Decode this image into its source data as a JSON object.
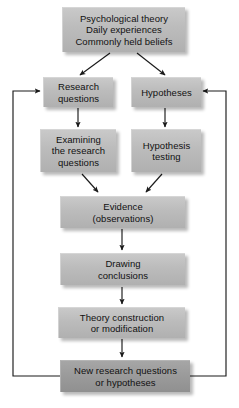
{
  "diagram": {
    "colors": {
      "box_fill_light": "#bcbcbc",
      "box_fill_dark": "#9b9b9b",
      "text": "#111111",
      "arrow": "#1a1a1a",
      "background": "#ffffff"
    },
    "nodes": [
      {
        "id": "sources",
        "label": "Psychological theory\nDaily experiences\nCommonly held beliefs",
        "shade": "light"
      },
      {
        "id": "research-questions",
        "label": "Research\nquestions",
        "shade": "light"
      },
      {
        "id": "hypotheses",
        "label": "Hypotheses",
        "shade": "light"
      },
      {
        "id": "examining-research-questions",
        "label": "Examining\nthe research\nquestions",
        "shade": "light"
      },
      {
        "id": "hypothesis-testing",
        "label": "Hypothesis\ntesting",
        "shade": "light"
      },
      {
        "id": "evidence",
        "label": "Evidence\n(observations)",
        "shade": "light"
      },
      {
        "id": "drawing-conclusions",
        "label": "Drawing\nconclusions",
        "shade": "light"
      },
      {
        "id": "theory-construction",
        "label": "Theory construction\nor modification",
        "shade": "light"
      },
      {
        "id": "new-research-questions",
        "label": "New research questions\nor hypotheses",
        "shade": "dark"
      }
    ],
    "edges": [
      {
        "from": "sources",
        "to": "research-questions",
        "kind": "diagonal"
      },
      {
        "from": "sources",
        "to": "hypotheses",
        "kind": "diagonal"
      },
      {
        "from": "research-questions",
        "to": "examining-research-questions",
        "kind": "vertical"
      },
      {
        "from": "hypotheses",
        "to": "hypothesis-testing",
        "kind": "vertical"
      },
      {
        "from": "examining-research-questions",
        "to": "evidence",
        "kind": "diagonal"
      },
      {
        "from": "hypothesis-testing",
        "to": "evidence",
        "kind": "diagonal"
      },
      {
        "from": "evidence",
        "to": "drawing-conclusions",
        "kind": "vertical"
      },
      {
        "from": "drawing-conclusions",
        "to": "theory-construction",
        "kind": "vertical"
      },
      {
        "from": "theory-construction",
        "to": "new-research-questions",
        "kind": "vertical"
      },
      {
        "from": "new-research-questions",
        "to": "research-questions",
        "kind": "feedback-left"
      },
      {
        "from": "new-research-questions",
        "to": "hypotheses",
        "kind": "feedback-right"
      }
    ]
  }
}
